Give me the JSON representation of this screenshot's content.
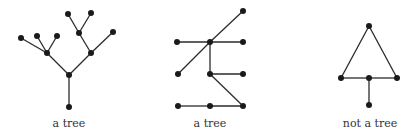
{
  "figures": [
    {
      "caption": "a tree",
      "caption_pos": [
        69,
        117
      ],
      "nodes": [
        [
          69,
          107
        ],
        [
          69,
          75
        ],
        [
          47,
          53
        ],
        [
          91,
          53
        ],
        [
          21,
          38
        ],
        [
          37,
          36
        ],
        [
          57,
          36
        ],
        [
          113,
          32
        ],
        [
          79,
          33
        ],
        [
          68,
          14
        ],
        [
          91,
          13
        ]
      ],
      "edges": [
        [
          0,
          1
        ],
        [
          1,
          2
        ],
        [
          1,
          3
        ],
        [
          2,
          4
        ],
        [
          2,
          5
        ],
        [
          2,
          6
        ],
        [
          3,
          7
        ],
        [
          3,
          8
        ],
        [
          8,
          9
        ],
        [
          8,
          10
        ]
      ]
    },
    {
      "caption": "a tree",
      "caption_pos": [
        210,
        117
      ],
      "nodes": [
        [
          210,
          42
        ],
        [
          177,
          42
        ],
        [
          243,
          42
        ],
        [
          243,
          11
        ],
        [
          178,
          74
        ],
        [
          210,
          74
        ],
        [
          243,
          74
        ],
        [
          243,
          106
        ],
        [
          178,
          106
        ],
        [
          210,
          106
        ]
      ],
      "edges": [
        [
          0,
          1
        ],
        [
          0,
          2
        ],
        [
          0,
          3
        ],
        [
          0,
          4
        ],
        [
          0,
          5
        ],
        [
          5,
          6
        ],
        [
          5,
          7
        ],
        [
          8,
          9
        ],
        [
          9,
          7
        ]
      ]
    },
    {
      "caption": "not a tree",
      "caption_pos": [
        370,
        117
      ],
      "nodes": [
        [
          369,
          26
        ],
        [
          341,
          78
        ],
        [
          369,
          78
        ],
        [
          397,
          78
        ],
        [
          369,
          105
        ]
      ],
      "edges": [
        [
          0,
          1
        ],
        [
          0,
          3
        ],
        [
          1,
          2
        ],
        [
          2,
          3
        ],
        [
          2,
          4
        ]
      ]
    }
  ],
  "style": {
    "edge_color": "#2a2a2a",
    "node_color": "#1a1a1a",
    "node_radius": 3
  }
}
